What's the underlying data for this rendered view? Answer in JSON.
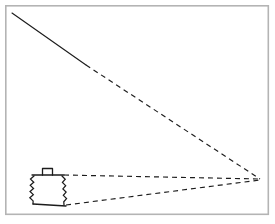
{
  "figure": {
    "background_color": "#ffffff",
    "ink_color": "#1c1c1c",
    "frame_color": "#b4b4b4",
    "canvas": {
      "width": 275,
      "height": 224
    },
    "frame": {
      "x": 5,
      "y": 5,
      "width": 264,
      "height": 210
    }
  },
  "chart_data": {
    "type": "line",
    "xlabel": "",
    "ylabel": "",
    "xlim": [
      0,
      275
    ],
    "ylim": [
      224,
      0
    ],
    "grid": false,
    "legend": "none",
    "vanishing_point": {
      "x": 260,
      "y": 179
    },
    "series": [
      {
        "name": "upper-sight-line-solid",
        "style": "solid",
        "points": [
          [
            12,
            13
          ],
          [
            86,
            65
          ]
        ]
      },
      {
        "name": "upper-sight-line-dashed",
        "style": "dashed",
        "points": [
          [
            86,
            65
          ],
          [
            260,
            179
          ]
        ]
      },
      {
        "name": "container-top-sight-line",
        "style": "dashed",
        "points": [
          [
            64,
            175
          ],
          [
            260,
            179
          ]
        ]
      },
      {
        "name": "container-base-sight-line",
        "style": "dashed",
        "points": [
          [
            66,
            205
          ],
          [
            260,
            180
          ]
        ]
      }
    ],
    "annotations": [
      {
        "name": "container-lid",
        "shape": "polyline",
        "style": "solid",
        "points": [
          [
            32,
            175
          ],
          [
            64,
            175
          ]
        ]
      },
      {
        "name": "container-lid-handle",
        "shape": "rect",
        "style": "solid",
        "x": 42,
        "y": 168,
        "width": 11,
        "height": 7
      },
      {
        "name": "container-base",
        "shape": "polyline",
        "style": "solid",
        "points": [
          [
            33,
            204
          ],
          [
            66,
            206
          ]
        ]
      },
      {
        "name": "container-left-bellows",
        "shape": "zigzag",
        "style": "solid",
        "from": [
          34,
          176
        ],
        "to": [
          33,
          204
        ],
        "amplitude": 3.4,
        "segments": 9
      },
      {
        "name": "container-right-bellows",
        "shape": "zigzag",
        "style": "solid",
        "from": [
          62,
          176
        ],
        "to": [
          64,
          205
        ],
        "amplitude": 3.0,
        "segments": 9
      }
    ]
  }
}
